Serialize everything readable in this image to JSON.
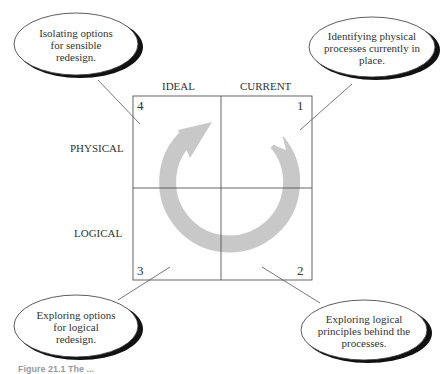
{
  "columns": {
    "left": "IDEAL",
    "right": "CURRENT"
  },
  "rows": {
    "top": "PHYSICAL",
    "bottom": "LOGICAL"
  },
  "quadrants": [
    {
      "number": "1",
      "position": "top-right"
    },
    {
      "number": "2",
      "position": "bottom-right"
    },
    {
      "number": "3",
      "position": "bottom-left"
    },
    {
      "number": "4",
      "position": "top-left"
    }
  ],
  "callouts": {
    "q4": [
      "Isolating options",
      "for sensible",
      "redesign."
    ],
    "q1": [
      "Identifying physical",
      "processes currently in",
      "place."
    ],
    "q3": [
      "Exploring options",
      "for logical",
      "redesign."
    ],
    "q2": [
      "Exploring logical",
      "principles behind the",
      "processes."
    ]
  },
  "caption": "Figure 21.1 The ...",
  "colors": {
    "arrow": "#c8c8c8",
    "lines": "#555555",
    "shadow": "#111111"
  }
}
